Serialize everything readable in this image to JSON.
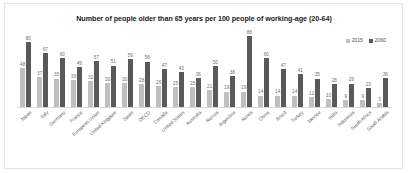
{
  "chart_data": {
    "type": "bar",
    "title": "Number of people older than 65 years per 100 people of working-age (20-64)",
    "xlabel": "",
    "ylabel": "",
    "ylim": [
      0,
      95
    ],
    "grid": false,
    "legend_position": "top-right",
    "categories": [
      "Japan",
      "Italy",
      "Germany",
      "France",
      "European Union",
      "United Kingdom",
      "Spain",
      "OECD",
      "Canada",
      "United States",
      "Australia",
      "Russia",
      "Argentina",
      "Korea",
      "China",
      "Brazil",
      "Turkey",
      "Mexico",
      "India",
      "Indonesia",
      "South Africa",
      "Saudi Arabia"
    ],
    "series": [
      {
        "name": "2015",
        "color": "#bfbfbf",
        "values": [
          48,
          37,
          35,
          33,
          32,
          30,
          30,
          28,
          26,
          25,
          25,
          21,
          19,
          19,
          14,
          14,
          14,
          12,
          10,
          9,
          9,
          5
        ]
      },
      {
        "name": "2060",
        "color": "#595959",
        "values": [
          80,
          67,
          60,
          49,
          57,
          51,
          59,
          56,
          47,
          43,
          36,
          50,
          38,
          88,
          60,
          47,
          41,
          35,
          28,
          29,
          23,
          36
        ]
      }
    ]
  },
  "legend": {
    "items": [
      {
        "label": "2015",
        "color": "#bfbfbf"
      },
      {
        "label": "2060",
        "color": "#595959"
      }
    ]
  },
  "colors": {
    "series_2015": "#bfbfbf",
    "series_2060": "#595959",
    "title": "#1b1b1b",
    "axis_label": "#666666",
    "background": "#ffffff",
    "frame_border": "#e3e3e3"
  }
}
